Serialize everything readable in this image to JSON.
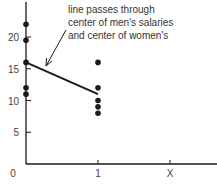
{
  "chart_data": {
    "type": "scatter",
    "title": "",
    "xlabel": "",
    "ylabel": "",
    "x_ticks": [
      {
        "value": 0,
        "label": "0"
      },
      {
        "value": 1,
        "label": "1"
      },
      {
        "value": 2,
        "label": "X"
      }
    ],
    "y_ticks": [
      5,
      10,
      15,
      20
    ],
    "ylim": [
      0,
      25
    ],
    "xlim": [
      0,
      2.6
    ],
    "grid": false,
    "series": [
      {
        "name": "men",
        "x": 0,
        "values": [
          22,
          19.5,
          16,
          12,
          11
        ]
      },
      {
        "name": "women",
        "x": 1,
        "values": [
          16,
          12,
          10,
          9,
          8
        ]
      }
    ],
    "line": {
      "from": [
        0,
        16
      ],
      "to": [
        1,
        11
      ]
    },
    "annotation": {
      "lines": [
        "line passes through",
        "center of men's salaries",
        "and center of women's"
      ]
    }
  },
  "colors": {
    "ink": "#1a1a1a",
    "text": "#333333"
  }
}
